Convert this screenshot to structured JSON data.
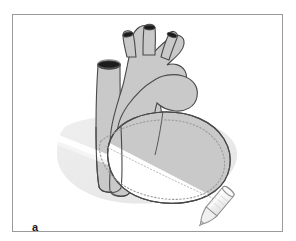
{
  "figure": {
    "panel_label": "a",
    "caption_text": "",
    "frame_border_color": "#9a9a9a",
    "background_color": "#ffffff"
  },
  "illustration": {
    "subject": "heart-with-ultrasound-probe",
    "colors": {
      "organ_fill": "#c9c9c9",
      "organ_fill_shadowed": "#bdbdbd",
      "organ_outline": "#4a4a4a",
      "vessel_lumen": "#1c1c1c",
      "beam_fill": "#fbfbfb",
      "beam_edge": "#e8e8e8",
      "ground_shadow": "#e3e3e3",
      "illuminated_fill": "#ffffff",
      "plane_dotted_line": "#9b9b9b",
      "probe_body": "#f2f2f2",
      "probe_outline": "#8d8d8d"
    },
    "parts": [
      {
        "name": "aortic-arch",
        "label": "aortic arch"
      },
      {
        "name": "brachiocephalic-trunk",
        "label": "brachiocephalic trunk"
      },
      {
        "name": "left-common-carotid-artery",
        "label": "left common carotid artery"
      },
      {
        "name": "left-subclavian-artery",
        "label": "left subclavian artery"
      },
      {
        "name": "superior-vena-cava",
        "label": "superior vena cava"
      },
      {
        "name": "pulmonary-trunk",
        "label": "pulmonary trunk"
      },
      {
        "name": "right-ventricle",
        "label": "right ventricle"
      },
      {
        "name": "left-ventricle",
        "label": "left ventricle"
      },
      {
        "name": "inferior-vena-cava",
        "label": "inferior vena cava"
      },
      {
        "name": "ultrasound-probe",
        "label": "ultrasound transducer"
      },
      {
        "name": "ultrasound-beam-plane",
        "label": "imaging plane"
      }
    ]
  }
}
